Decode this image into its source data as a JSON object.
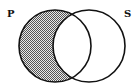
{
  "diagram": {
    "type": "venn",
    "sets": [
      {
        "id": "P",
        "label": "P",
        "cx": 55,
        "cy": 46,
        "r": 36
      },
      {
        "id": "S",
        "label": "S",
        "cx": 89,
        "cy": 46,
        "r": 36
      }
    ],
    "shaded_region": "P minus S",
    "shading_pattern": "checkerboard",
    "colors": {
      "stroke": "#111111",
      "shade_dark": "#555555",
      "shade_light": "#e8e8e8",
      "background": "#ffffff"
    }
  }
}
